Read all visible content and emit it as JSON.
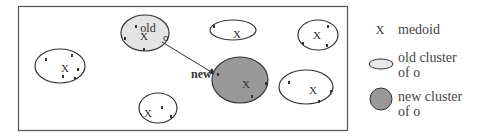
{
  "diagram": {
    "labels": {
      "old": "old",
      "o": "o",
      "new": "new",
      "medoid_mark": "X"
    },
    "colors": {
      "frame": "#555555",
      "outline": "#333333",
      "old_cluster_fill": "#e4e4e4",
      "new_cluster_fill": "#999999",
      "point": "#333333"
    }
  },
  "legend": {
    "items": [
      {
        "symbol": "medoid-x",
        "text_line1": "medoid",
        "text_line2": ""
      },
      {
        "symbol": "light-ellipse",
        "text_line1": "old cluster",
        "text_line2": "of o"
      },
      {
        "symbol": "dark-circle",
        "text_line1": "new cluster",
        "text_line2": "of o"
      }
    ]
  }
}
